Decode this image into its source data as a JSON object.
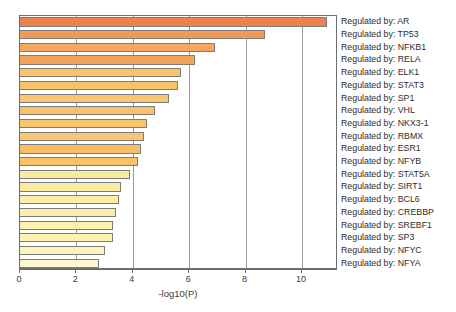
{
  "chart_data": {
    "type": "bar",
    "orientation": "horizontal",
    "title": "",
    "subtitle": "",
    "xlabel": "-log10(P)",
    "ylabel": "",
    "xlim": [
      0,
      11.28
    ],
    "ylim": [
      0,
      20
    ],
    "grid": true,
    "grid_axis": "x",
    "legend": false,
    "xticks": [
      0,
      2,
      4,
      6,
      8,
      10
    ],
    "xticklabels": [
      "0",
      "2",
      "4",
      "6",
      "8",
      "10"
    ],
    "categories": [
      "Regulated by: AR",
      "Regulated by: TP53",
      "Regulated by: NFKB1",
      "Regulated by: RELA",
      "Regulated by: ELK1",
      "Regulated by: STAT3",
      "Regulated by: SP1",
      "Regulated by: VHL",
      "Regulated by: NKX3-1",
      "Regulated by: RBMX",
      "Regulated by: ESR1",
      "Regulated by: NFYB",
      "Regulated by: STAT5A",
      "Regulated by: SIRT1",
      "Regulated by: BCL6",
      "Regulated by: CREBBP",
      "Regulated by: SREBF1",
      "Regulated by: SP3",
      "Regulated by: NFYC",
      "Regulated by: NFYA"
    ],
    "values": [
      10.9,
      8.7,
      6.9,
      6.2,
      5.7,
      5.6,
      5.3,
      4.8,
      4.5,
      4.4,
      4.3,
      4.2,
      3.9,
      3.6,
      3.5,
      3.4,
      3.3,
      3.3,
      3.0,
      2.8
    ],
    "bar_colors": [
      "#e9834b",
      "#f09a55",
      "#f4a75f",
      "#f4a458",
      "#f8c36a",
      "#f8c46b",
      "#f9c770",
      "#f8c16a",
      "#f9c56d",
      "#f9c76f",
      "#f8bd66",
      "#f9c269",
      "#faeaa0",
      "#faeaa2",
      "#fbeda8",
      "#fbefab",
      "#fcf0ae",
      "#fcf2b2",
      "#fdf4ba",
      "#fdf8d4"
    ]
  },
  "axis": {
    "x_title": "-log10(P)"
  }
}
